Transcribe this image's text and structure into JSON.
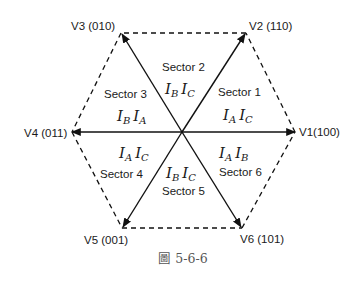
{
  "figure": {
    "caption": "圖 5-6-6",
    "colors": {
      "line": "#111111",
      "text": "#1a1a1a",
      "caption": "#555555"
    }
  },
  "vectors": [
    {
      "id": "V1",
      "label": "V1(100)"
    },
    {
      "id": "V2",
      "label": "V2 (110)"
    },
    {
      "id": "V3",
      "label": "V3 (010)"
    },
    {
      "id": "V4",
      "label": "V4 (011)"
    },
    {
      "id": "V5",
      "label": "V5 (001)"
    },
    {
      "id": "V6",
      "label": "V6 (101)"
    }
  ],
  "sectors": [
    {
      "label": "Sector 1",
      "currents": [
        {
          "base": "I",
          "sub": "A"
        },
        {
          "base": "I",
          "sub": "C"
        }
      ]
    },
    {
      "label": "Sector 2",
      "currents": [
        {
          "base": "I",
          "sub": "B"
        },
        {
          "base": "I",
          "sub": "C"
        }
      ]
    },
    {
      "label": "Sector 3",
      "currents": [
        {
          "base": "I",
          "sub": "B"
        },
        {
          "base": "I",
          "sub": "A"
        }
      ]
    },
    {
      "label": "Sector 4",
      "currents": [
        {
          "base": "I",
          "sub": "A"
        },
        {
          "base": "I",
          "sub": "C"
        }
      ]
    },
    {
      "label": "Sector 5",
      "currents": [
        {
          "base": "I",
          "sub": "B"
        },
        {
          "base": "I",
          "sub": "C"
        }
      ]
    },
    {
      "label": "Sector 6",
      "currents": [
        {
          "base": "I",
          "sub": "A"
        },
        {
          "base": "I",
          "sub": "B"
        }
      ]
    }
  ]
}
